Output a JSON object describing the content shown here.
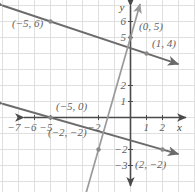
{
  "figure": {
    "type": "coordinate-plane-graph",
    "background": "#ffffff",
    "grid_color": "#d8d8d8",
    "axis_color": "#4a4a4a",
    "line_a_color": "#6b6b6b",
    "line_b_color": "#9a9a9a",
    "point_color": "#8a8a8a",
    "label_color": "#5f5f5f"
  },
  "axes": {
    "x_label": "x",
    "y_label": "y",
    "x_ticks": [
      {
        "value": -7,
        "label": "−7"
      },
      {
        "value": -6,
        "label": "−6"
      },
      {
        "value": -5,
        "label": "−5"
      },
      {
        "value": -2,
        "label": "−2"
      },
      {
        "value": 1,
        "label": "1"
      },
      {
        "value": 2,
        "label": "2"
      }
    ],
    "y_ticks": [
      {
        "value": 6,
        "label": "6"
      },
      {
        "value": 5,
        "label": "5"
      },
      {
        "value": 2,
        "label": "2"
      },
      {
        "value": 1,
        "label": "1"
      },
      {
        "value": -2,
        "label": "−2"
      },
      {
        "value": -3,
        "label": "−3"
      }
    ],
    "xlim": [
      -8,
      3
    ],
    "ylim": [
      -4,
      7
    ],
    "grid": true
  },
  "chart_data": {
    "type": "line",
    "title": "",
    "xlabel": "x",
    "ylabel": "y",
    "xlim": [
      -8,
      3
    ],
    "ylim": [
      -4,
      7
    ],
    "grid": true,
    "legend": "none",
    "series": [
      {
        "name": "line-through-(-5,6)-and-(1,4)",
        "color": "#6b6b6b",
        "style": "solid-double-arrow",
        "points": [
          {
            "x": -5,
            "y": 6
          },
          {
            "x": 1,
            "y": 4
          }
        ],
        "slope": -0.3333,
        "intercept": 4.3333,
        "x_extent": [
          -8,
          3
        ]
      },
      {
        "name": "line-through-(-5,0)-and-(2,-2)",
        "color": "#6b6b6b",
        "style": "solid-double-arrow",
        "points": [
          {
            "x": -5,
            "y": 0
          },
          {
            "x": 2,
            "y": -2
          }
        ],
        "slope": -0.2857,
        "intercept": -1.4286,
        "x_extent": [
          -8,
          3
        ]
      },
      {
        "name": "line-through-(0,5)-and-(-2,-2)",
        "color": "#9a9a9a",
        "style": "solid-double-arrow",
        "points": [
          {
            "x": 0,
            "y": 5
          },
          {
            "x": -2,
            "y": -2
          }
        ],
        "slope": 3.5,
        "intercept": 5,
        "x_extent": [
          -2.8,
          0.6
        ]
      }
    ],
    "annotations": [
      {
        "id": "pt-n5-6",
        "text": "(−5, 6)",
        "x": -5,
        "y": 6,
        "anchor": "below-left"
      },
      {
        "id": "pt-0-5",
        "text": "(0, 5)",
        "x": 0,
        "y": 5,
        "anchor": "right"
      },
      {
        "id": "pt-1-4",
        "text": "(1, 4)",
        "x": 1,
        "y": 4,
        "anchor": "above-right"
      },
      {
        "id": "pt-n5-0",
        "text": "(−5, 0)",
        "x": -5,
        "y": 0,
        "anchor": "above-right"
      },
      {
        "id": "pt-n2-n2",
        "text": "(−2, −2)",
        "x": -2,
        "y": -2,
        "anchor": "above-left"
      },
      {
        "id": "pt-2-n2",
        "text": "(2, −2)",
        "x": 2,
        "y": -2,
        "anchor": "below-right"
      }
    ],
    "marked_points": [
      {
        "x": -5,
        "y": 6
      },
      {
        "x": 0,
        "y": 5
      },
      {
        "x": 1,
        "y": 4
      },
      {
        "x": -5,
        "y": 0
      },
      {
        "x": -2,
        "y": -2
      },
      {
        "x": 2,
        "y": -2
      }
    ]
  }
}
